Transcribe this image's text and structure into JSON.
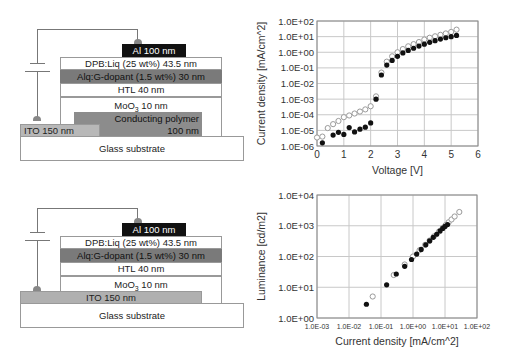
{
  "diagrams": [
    {
      "name": "device-with-conducting-polymer",
      "layers": {
        "al": "Al 100 nm",
        "dpb": "DPB:Liq (25 wt%) 43.5 nm",
        "alq": "Alq:G-dopant (1.5 wt%) 30 nm",
        "htl": "HTL 40 nm",
        "moo3_prefix": "MoO",
        "moo3_sub": "3",
        "moo3_suffix": " 10 nm",
        "polymer_line1": "Conducting polymer",
        "polymer_line2": "100 nm",
        "ito": "ITO 150 nm",
        "glass": "Glass substrate"
      }
    },
    {
      "name": "device-without-conducting-polymer",
      "layers": {
        "al": "Al 100 nm",
        "dpb": "DPB:Liq (25 wt%) 43.5 nm",
        "alq": "Alq:G-dopant (1.5 wt%) 30 nm",
        "htl": "HTL 40 nm",
        "moo3_prefix": "MoO",
        "moo3_sub": "3",
        "moo3_suffix": " 10 nm",
        "ito": "ITO 150 nm",
        "glass": "Glass substrate"
      }
    }
  ],
  "colors": {
    "al": "#111111",
    "alq": "#7a7a7a",
    "polymer": "#8c8c8c",
    "ito": "#b8b8b8",
    "white_layer": "#ffffff",
    "open_marker": "#9a9a9a",
    "filled_marker": "#111111",
    "grid": "#c8c8c8"
  },
  "chart_data": [
    {
      "type": "scatter",
      "title": "",
      "xlabel": "Voltage [V]",
      "ylabel": "Current density [mA/cm^2]",
      "xscale": "linear",
      "yscale": "log",
      "xlim": [
        0,
        6
      ],
      "ylim": [
        1e-06,
        100
      ],
      "xticks": [
        "0",
        "1",
        "2",
        "3",
        "4",
        "5",
        "6"
      ],
      "yticks": [
        "1.0E-06",
        "1.0E-05",
        "1.0E-04",
        "1.0E-03",
        "1.0E-02",
        "1.0E-01",
        "1.0E+00",
        "1.0E+01",
        "1.0E+02"
      ],
      "grid": true,
      "legend": null,
      "series": [
        {
          "name": "open-circles",
          "marker": "open",
          "x": [
            0.0,
            0.2,
            0.4,
            0.6,
            0.8,
            1.0,
            1.2,
            1.4,
            1.6,
            1.8,
            2.0,
            2.2,
            2.4,
            2.6,
            2.8,
            3.0,
            3.2,
            3.4,
            3.6,
            3.8,
            4.0,
            4.2,
            4.4,
            4.6,
            4.8,
            5.0,
            5.2
          ],
          "y": [
            3.5e-06,
            4e-06,
            1.4e-05,
            2.5e-05,
            4e-05,
            7e-05,
            9e-05,
            0.00012,
            0.00016,
            0.00022,
            0.00035,
            0.0015,
            0.05,
            0.25,
            0.55,
            1.0,
            1.6,
            2.4,
            3.3,
            4.5,
            6.5,
            8.5,
            10.5,
            13,
            16,
            20,
            28
          ]
        },
        {
          "name": "filled-circles",
          "marker": "filled",
          "x": [
            0.2,
            0.6,
            0.8,
            1.0,
            1.2,
            1.4,
            1.6,
            1.8,
            2.0,
            2.2,
            2.4,
            2.6,
            2.8,
            3.0,
            3.2,
            3.4,
            3.6,
            3.8,
            4.0,
            4.2,
            4.4,
            4.6,
            4.8,
            5.0,
            5.2
          ],
          "y": [
            1.6e-06,
            5e-06,
            7.5e-06,
            5.5e-06,
            1.5e-05,
            8e-06,
            1.2e-05,
            1.6e-05,
            3e-05,
            0.001,
            0.035,
            0.15,
            0.3,
            0.55,
            0.9,
            1.3,
            1.8,
            2.5,
            3.3,
            4.3,
            5.5,
            7,
            8.5,
            10,
            12
          ]
        }
      ]
    },
    {
      "type": "scatter",
      "title": "",
      "xlabel": "Current density [mA/cm^2]",
      "ylabel": "Luminance [cd/m2]",
      "xscale": "log",
      "yscale": "log",
      "xlim": [
        0.001,
        100
      ],
      "ylim": [
        1,
        10000
      ],
      "xticks": [
        "1.0E-03",
        "1.0E-02",
        "1.0E-01",
        "1.0E+00",
        "1.0E+01",
        "1.0E+02"
      ],
      "yticks": [
        "1.0E+00",
        "1.0E+01",
        "1.0E+02",
        "1.0E+03",
        "1.0E+04"
      ],
      "grid": true,
      "legend": null,
      "series": [
        {
          "name": "open-circles",
          "marker": "open",
          "x": [
            0.055,
            0.25,
            0.55,
            1.0,
            1.6,
            2.4,
            3.3,
            4.5,
            6.5,
            8.5,
            10.5,
            13,
            16,
            20,
            28
          ],
          "y": [
            5,
            25,
            55,
            100,
            160,
            240,
            330,
            450,
            650,
            850,
            1050,
            1300,
            1600,
            2000,
            2800
          ]
        },
        {
          "name": "filled-circles",
          "marker": "filled",
          "x": [
            0.035,
            0.15,
            0.3,
            0.55,
            0.9,
            1.3,
            1.8,
            2.5,
            3.3,
            4.3,
            5.5,
            7,
            8.5,
            10,
            12
          ],
          "y": [
            2.8,
            12,
            27,
            48,
            80,
            120,
            170,
            240,
            320,
            420,
            530,
            680,
            820,
            950,
            1100
          ]
        }
      ]
    }
  ]
}
